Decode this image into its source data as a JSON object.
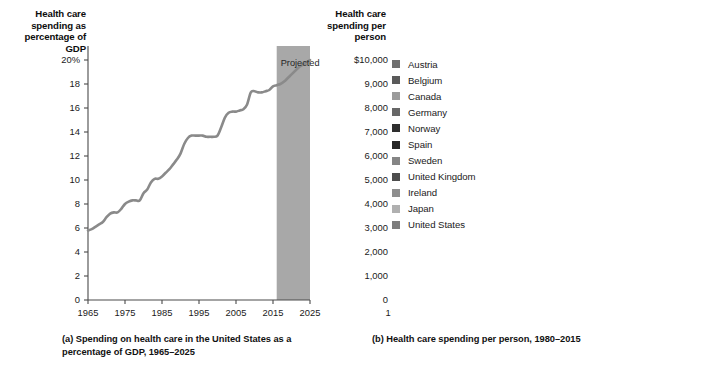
{
  "figure": {
    "panel_a": {
      "axis_title": "Health care spending as percentage of GDP",
      "caption": "(a) Spending on health care in the United States as a percentage of GDP, 1965–2025",
      "projected_label": "Projected",
      "projected_band": {
        "start": 2016,
        "end": 2025,
        "color": "#a8a8a8"
      }
    },
    "panel_b": {
      "axis_title": "Health care spending per person",
      "caption": "(b) Health care spending per person, 1980–2015"
    }
  },
  "chart_data": [
    {
      "id": "panel-a",
      "type": "line",
      "title": "Health care spending as percentage of GDP",
      "caption": "(a) Spending on health care in the United States as a percentage of GDP, 1965–2025",
      "xlabel": "",
      "ylabel": "Health care spending as percentage of GDP",
      "xlim": [
        1965,
        2025
      ],
      "ylim": [
        0,
        20
      ],
      "xticks": [
        1965,
        1975,
        1985,
        1995,
        2005,
        2015,
        2025
      ],
      "xticklabels": [
        "1965",
        "1975",
        "1985",
        "1995",
        "2005",
        "2015",
        "2025"
      ],
      "yticks": [
        0,
        2,
        4,
        6,
        8,
        10,
        12,
        14,
        16,
        18,
        20
      ],
      "yticklabels": [
        "0",
        "2",
        "4",
        "6",
        "8",
        "10",
        "12",
        "14",
        "16",
        "18",
        "20%"
      ],
      "grid": false,
      "legend": "none",
      "annotations": [
        {
          "text": "Projected",
          "x_start": 2016,
          "x_end": 2025,
          "shaded": true,
          "color": "#a8a8a8"
        }
      ],
      "series": [
        {
          "name": "United States health care spending as share of GDP",
          "color": "#8a8a8a",
          "x": [
            1965,
            1966,
            1967,
            1968,
            1969,
            1970,
            1971,
            1972,
            1973,
            1974,
            1975,
            1976,
            1977,
            1978,
            1979,
            1980,
            1981,
            1982,
            1983,
            1984,
            1985,
            1986,
            1987,
            1988,
            1989,
            1990,
            1991,
            1992,
            1993,
            1994,
            1995,
            1996,
            1997,
            1998,
            1999,
            2000,
            2001,
            2002,
            2003,
            2004,
            2005,
            2006,
            2007,
            2008,
            2009,
            2010,
            2011,
            2012,
            2013,
            2014,
            2015,
            2016,
            2017,
            2018,
            2019,
            2020,
            2021,
            2022,
            2023,
            2024,
            2025
          ],
          "values": [
            5.8,
            5.9,
            6.1,
            6.3,
            6.5,
            6.9,
            7.2,
            7.3,
            7.3,
            7.6,
            8.0,
            8.2,
            8.3,
            8.3,
            8.3,
            8.9,
            9.2,
            9.8,
            10.1,
            10.1,
            10.3,
            10.6,
            10.9,
            11.3,
            11.7,
            12.2,
            13.0,
            13.5,
            13.7,
            13.7,
            13.7,
            13.7,
            13.6,
            13.6,
            13.6,
            13.7,
            14.4,
            15.2,
            15.6,
            15.7,
            15.7,
            15.8,
            15.9,
            16.3,
            17.3,
            17.4,
            17.3,
            17.3,
            17.4,
            17.5,
            17.8,
            17.9,
            18.0,
            18.2,
            18.5,
            18.8,
            19.1,
            19.4,
            19.6,
            19.8,
            20.0
          ]
        }
      ]
    },
    {
      "id": "panel-b",
      "type": "line",
      "title": "Health care spending per person",
      "caption": "(b) Health care spending per person, 1980–2015",
      "xlabel": "",
      "ylabel": "Health care spending per person",
      "xlim": [
        1980,
        2015
      ],
      "ylim": [
        0,
        10000
      ],
      "xticks": [
        1980,
        1985,
        1990,
        1995,
        2000,
        2005,
        2010,
        2015
      ],
      "xticklabels": [
        "1980",
        "1985",
        "1990",
        "1995",
        "2000",
        "2005",
        "2010",
        "2015"
      ],
      "yticks": [
        0,
        1000,
        2000,
        3000,
        4000,
        5000,
        6000,
        7000,
        8000,
        9000,
        10000
      ],
      "yticklabels": [
        "0",
        "1,000",
        "2,000",
        "3,000",
        "4,000",
        "5,000",
        "6,000",
        "7,000",
        "8,000",
        "9,000",
        "$10,000"
      ],
      "grid": false,
      "legend": "upper-left-inside",
      "x": [
        1980,
        1985,
        1990,
        1995,
        2000,
        2005,
        2010,
        2015
      ],
      "series": [
        {
          "name": "Austria",
          "color": "#6f6f6f",
          "values": [
            750,
            1150,
            1700,
            2300,
            2900,
            3800,
            4400,
            5100
          ]
        },
        {
          "name": "Belgium",
          "color": "#5a5a5a",
          "values": [
            620,
            900,
            1400,
            1900,
            2300,
            3200,
            3900,
            4400
          ]
        },
        {
          "name": "Canada",
          "color": "#9b9b9b",
          "values": [
            800,
            1250,
            1800,
            2050,
            2500,
            3400,
            4300,
            4600
          ]
        },
        {
          "name": "Germany",
          "color": "#676767",
          "values": [
            970,
            1350,
            1800,
            2500,
            2800,
            3500,
            4400,
            5300
          ]
        },
        {
          "name": "Norway",
          "color": "#2e2e2e",
          "values": [
            700,
            1150,
            1650,
            2300,
            3300,
            4700,
            5600,
            6600
          ]
        },
        {
          "name": "Spain",
          "color": "#262626",
          "values": [
            370,
            620,
            950,
            1250,
            1600,
            2350,
            3000,
            3150
          ]
        },
        {
          "name": "Sweden",
          "color": "#858585",
          "values": [
            950,
            1300,
            1750,
            1900,
            2350,
            3000,
            3800,
            5200
          ]
        },
        {
          "name": "United Kingdom",
          "color": "#4d4d4d",
          "values": [
            470,
            720,
            1000,
            1400,
            1850,
            2800,
            3350,
            4100
          ]
        },
        {
          "name": "Ireland",
          "color": "#8e8e8e",
          "values": [
            520,
            680,
            820,
            1250,
            1800,
            3100,
            3800,
            4800
          ]
        },
        {
          "name": "Japan",
          "color": "#b0b0b0",
          "values": [
            580,
            870,
            1130,
            1550,
            1950,
            2400,
            3200,
            4200
          ]
        },
        {
          "name": "United States",
          "color": "#7d7d7d",
          "values": [
            1050,
            1800,
            2600,
            3600,
            4550,
            6450,
            7900,
            9400
          ]
        }
      ]
    }
  ]
}
